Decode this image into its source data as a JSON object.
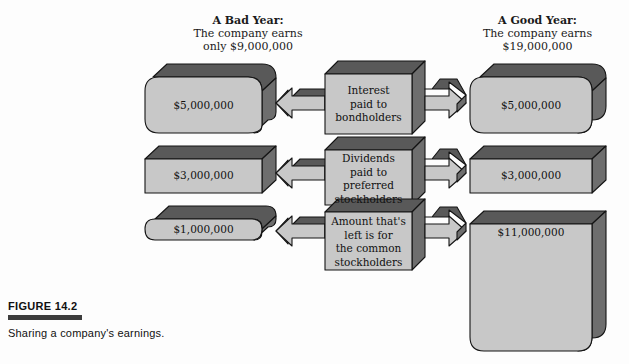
{
  "figure": {
    "number_label": "FIGURE 14.2",
    "caption": "Sharing a company's earnings.",
    "colors": {
      "face": "#c8c8c8",
      "top_face": "#595959",
      "side_face": "#6e6e6e",
      "outline": "#141414",
      "background": "#fdfdfd",
      "rule": "#3d3d3d"
    }
  },
  "headers": {
    "left": {
      "title": "A Bad Year:",
      "line2": "The company earns",
      "line3": "only $9,000,000"
    },
    "right": {
      "title": "A Good Year:",
      "line2": "The company earns",
      "line3": "$19,000,000"
    }
  },
  "left_column": {
    "boxes": [
      {
        "amount": "$5,000,000"
      },
      {
        "amount": "$3,000,000"
      },
      {
        "amount": "$1,000,000"
      }
    ]
  },
  "center_column": {
    "boxes": [
      {
        "lines": [
          "Interest",
          "paid to",
          "bondholders"
        ]
      },
      {
        "lines": [
          "Dividends",
          "paid to",
          "preferred",
          "stockholders"
        ]
      },
      {
        "lines": [
          "Amount that's",
          "left is for",
          "the common",
          "stockholders"
        ]
      }
    ]
  },
  "right_column": {
    "boxes": [
      {
        "amount": "$5,000,000"
      },
      {
        "amount": "$3,000,000"
      },
      {
        "amount": "$11,000,000"
      }
    ]
  },
  "arrows": {
    "left_direction": "left",
    "right_direction": "right",
    "count_per_row": 2,
    "rows": 3
  }
}
